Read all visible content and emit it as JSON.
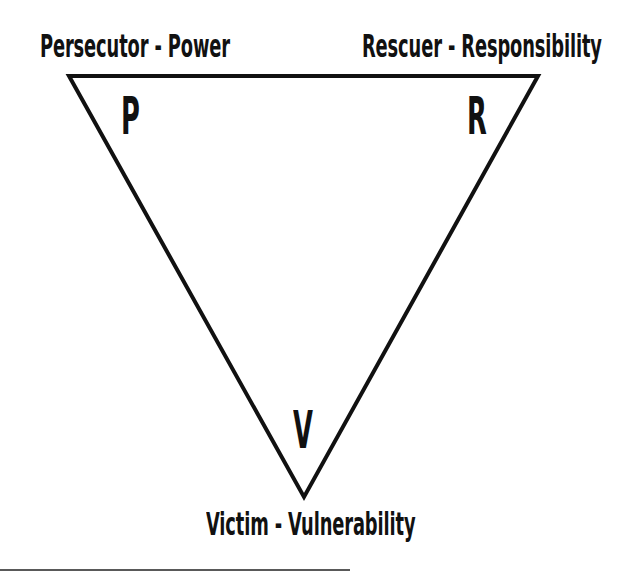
{
  "diagram": {
    "vertices": [
      {
        "id": "persecutor",
        "letter": "P",
        "label": "Persecutor - Power",
        "x": 69,
        "y": 76
      },
      {
        "id": "rescuer",
        "letter": "R",
        "label": "Rescuer - Responsibility",
        "x": 538,
        "y": 76
      },
      {
        "id": "victim",
        "letter": "V",
        "label": "Victim - Vulnerability",
        "x": 304,
        "y": 497
      }
    ],
    "stroke_color": "#111111",
    "background": "#ffffff",
    "footnote_rule": {
      "x1": 0,
      "x2": 350,
      "y": 570
    }
  }
}
